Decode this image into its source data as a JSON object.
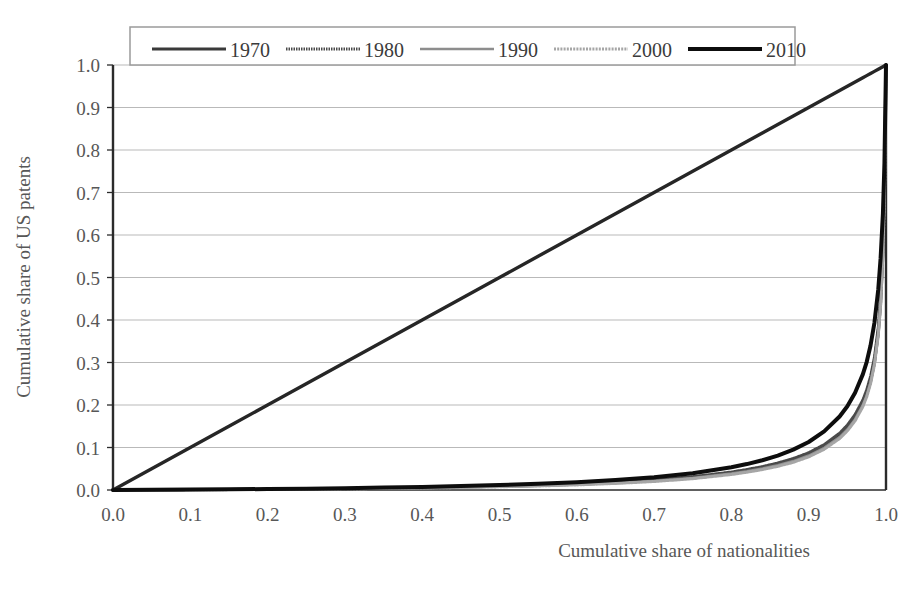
{
  "chart_data": {
    "type": "line",
    "title": "",
    "subtitle": "",
    "xlabel": "Cumulative share of nationalities",
    "ylabel": "Cumulative share of US patents",
    "xlim": [
      0.0,
      1.0
    ],
    "ylim": [
      0.0,
      1.0
    ],
    "xticks": [
      "0.0",
      "0.1",
      "0.2",
      "0.3",
      "0.4",
      "0.5",
      "0.6",
      "0.7",
      "0.8",
      "0.9",
      "1.0"
    ],
    "yticks": [
      "0.0",
      "0.1",
      "0.2",
      "0.3",
      "0.4",
      "0.5",
      "0.6",
      "0.7",
      "0.8",
      "0.9",
      "1.0"
    ],
    "grid": "horizontal",
    "legend_position": "top-inside",
    "legend_entries": [
      "1970",
      "1980",
      "1990",
      "2000",
      "2010"
    ],
    "x": [
      0.0,
      0.05,
      0.1,
      0.15,
      0.2,
      0.25,
      0.3,
      0.35,
      0.4,
      0.45,
      0.5,
      0.55,
      0.6,
      0.65,
      0.7,
      0.75,
      0.8,
      0.82,
      0.84,
      0.86,
      0.88,
      0.9,
      0.92,
      0.94,
      0.95,
      0.96,
      0.97,
      0.975,
      0.98,
      0.985,
      0.99,
      0.993,
      0.996,
      0.998,
      1.0
    ],
    "series": [
      {
        "name": "1970",
        "color": "#3a3a3a",
        "width": 3.2,
        "dash": "none",
        "values": [
          0.0,
          0.0003,
          0.0007,
          0.0012,
          0.0018,
          0.0025,
          0.0033,
          0.0043,
          0.0055,
          0.007,
          0.0088,
          0.011,
          0.0138,
          0.0175,
          0.0225,
          0.0295,
          0.04,
          0.0455,
          0.052,
          0.06,
          0.07,
          0.083,
          0.101,
          0.127,
          0.145,
          0.169,
          0.202,
          0.225,
          0.256,
          0.3,
          0.37,
          0.44,
          0.56,
          0.7,
          1.0
        ]
      },
      {
        "name": "1980",
        "color": "#4a4a4a",
        "width": 2.8,
        "dash": "1.5 1.0",
        "values": [
          0.0,
          0.0003,
          0.0007,
          0.0012,
          0.0018,
          0.0026,
          0.0035,
          0.0045,
          0.0058,
          0.0074,
          0.0093,
          0.0117,
          0.0147,
          0.0187,
          0.024,
          0.0315,
          0.0425,
          0.0483,
          0.0552,
          0.0636,
          0.0742,
          0.088,
          0.107,
          0.134,
          0.153,
          0.178,
          0.212,
          0.236,
          0.268,
          0.313,
          0.384,
          0.454,
          0.572,
          0.71,
          1.0
        ]
      },
      {
        "name": "1990",
        "color": "#8d8d8d",
        "width": 2.6,
        "dash": "none",
        "values": [
          0.0,
          0.0002,
          0.0006,
          0.001,
          0.0016,
          0.0022,
          0.003,
          0.0039,
          0.005,
          0.0064,
          0.0081,
          0.0102,
          0.0129,
          0.0165,
          0.0213,
          0.0282,
          0.0385,
          0.044,
          0.0504,
          0.0582,
          0.068,
          0.081,
          0.099,
          0.1245,
          0.1425,
          0.1665,
          0.1995,
          0.2225,
          0.2535,
          0.2975,
          0.3675,
          0.4375,
          0.5575,
          0.698,
          1.0
        ]
      },
      {
        "name": "2000",
        "color": "#a6a6a6",
        "width": 3.0,
        "dash": "2.0 1.2",
        "values": [
          0.0,
          0.0002,
          0.0005,
          0.0009,
          0.0014,
          0.002,
          0.0027,
          0.0036,
          0.0046,
          0.0059,
          0.0075,
          0.0095,
          0.012,
          0.0154,
          0.02,
          0.0266,
          0.0365,
          0.0418,
          0.048,
          0.0556,
          0.0652,
          0.078,
          0.0958,
          0.121,
          0.139,
          0.1628,
          0.1958,
          0.2188,
          0.2498,
          0.2938,
          0.364,
          0.434,
          0.5545,
          0.695,
          1.0
        ]
      },
      {
        "name": "2010",
        "color": "#0d0d0d",
        "width": 4.0,
        "dash": "none",
        "values": [
          0.0,
          0.0004,
          0.0009,
          0.0015,
          0.0023,
          0.0032,
          0.0043,
          0.0056,
          0.0072,
          0.0092,
          0.0116,
          0.0146,
          0.0184,
          0.0234,
          0.03,
          0.0395,
          0.0535,
          0.061,
          0.07,
          0.081,
          0.095,
          0.113,
          0.138,
          0.173,
          0.197,
          0.229,
          0.272,
          0.301,
          0.34,
          0.393,
          0.472,
          0.545,
          0.65,
          0.77,
          1.0
        ]
      },
      {
        "name": "equality",
        "color": "#262626",
        "width": 3.4,
        "dash": "none",
        "values": [
          0.0,
          0.05,
          0.1,
          0.15,
          0.2,
          0.25,
          0.3,
          0.35,
          0.4,
          0.45,
          0.5,
          0.55,
          0.6,
          0.65,
          0.7,
          0.75,
          0.8,
          0.82,
          0.84,
          0.86,
          0.88,
          0.9,
          0.92,
          0.94,
          0.95,
          0.96,
          0.97,
          0.975,
          0.98,
          0.985,
          0.99,
          0.993,
          0.996,
          0.998,
          1.0
        ]
      }
    ]
  },
  "axes": {
    "x_title": "Cumulative share of nationalities",
    "y_title": "Cumulative share of US patents"
  },
  "legend": {
    "items": [
      {
        "label": "1970"
      },
      {
        "label": "1980"
      },
      {
        "label": "1990"
      },
      {
        "label": "2000"
      },
      {
        "label": "2010"
      }
    ]
  },
  "colors": {
    "gridline": "#b9b9b9",
    "axis": "#2b2b2b",
    "legend_border": "#9a9a9a",
    "plot_background": "#ffffff",
    "tick_text": "#575757"
  }
}
